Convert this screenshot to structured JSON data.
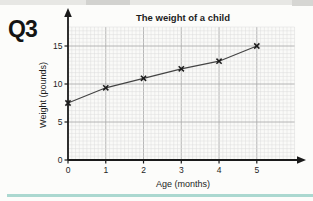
{
  "page": {
    "question_label": "Q3",
    "divider_color": "#abd8d0",
    "background": "#fcfcfa"
  },
  "chart_data": {
    "type": "line",
    "title": "The weight of a child",
    "xlabel": "Age (months)",
    "ylabel": "Weight (pounds)",
    "x": [
      0,
      1,
      2,
      3,
      4,
      5
    ],
    "values": [
      7.5,
      9.5,
      10.75,
      12,
      13,
      15
    ],
    "xticks": [
      "0",
      "1",
      "2",
      "3",
      "4",
      "5"
    ],
    "yticks": [
      "0",
      "5",
      "10",
      "15"
    ],
    "xlim": [
      0,
      6
    ],
    "ylim": [
      0,
      17.5
    ],
    "marker": "x",
    "grid": "on",
    "legend": "none",
    "line_color": "#444444",
    "marker_color": "#1c1c1c",
    "axis_color": "#1a1a1a",
    "grid_minor_color": "#dcdcdc",
    "grid_major_color": "#aeaeae"
  }
}
